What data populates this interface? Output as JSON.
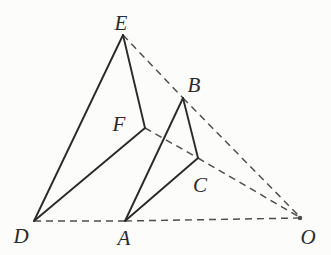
{
  "figure": {
    "background": "#fcfcfb",
    "solid_color": "#2a2a2a",
    "dashed_color": "#4c4c4c",
    "solid_width": 1.9,
    "dashed_width": 1.45,
    "dash_pattern": "7 5",
    "label_font_size": 21,
    "points": {
      "E": {
        "label": "E",
        "x": 123,
        "y": 35,
        "lx": 121,
        "ly": 30
      },
      "B": {
        "label": "B",
        "x": 183,
        "y": 98,
        "lx": 194,
        "ly": 92
      },
      "F": {
        "label": "F",
        "x": 145,
        "y": 128,
        "lx": 119,
        "ly": 131
      },
      "C": {
        "label": "C",
        "x": 198,
        "y": 158,
        "lx": 200,
        "ly": 192
      },
      "D": {
        "label": "D",
        "x": 34,
        "y": 221,
        "lx": 21,
        "ly": 243
      },
      "A": {
        "label": "A",
        "x": 125,
        "y": 221,
        "lx": 124,
        "ly": 245
      },
      "O": {
        "label": "O",
        "x": 301,
        "y": 218,
        "lx": 308,
        "ly": 244
      }
    },
    "solid_edges": [
      {
        "from": "D",
        "to": "E"
      },
      {
        "from": "E",
        "to": "F"
      },
      {
        "from": "F",
        "to": "D"
      },
      {
        "from": "A",
        "to": "B"
      },
      {
        "from": "B",
        "to": "C"
      },
      {
        "from": "C",
        "to": "A"
      }
    ],
    "dashed_edges": [
      {
        "from": "E",
        "to": "B"
      },
      {
        "from": "B",
        "to": "O"
      },
      {
        "from": "F",
        "to": "C"
      },
      {
        "from": "C",
        "to": "O"
      },
      {
        "from": "D",
        "to": "A"
      },
      {
        "from": "A",
        "to": "O"
      }
    ],
    "convergence_dot": {
      "x": 300,
      "y": 218,
      "r": 2.2
    }
  }
}
